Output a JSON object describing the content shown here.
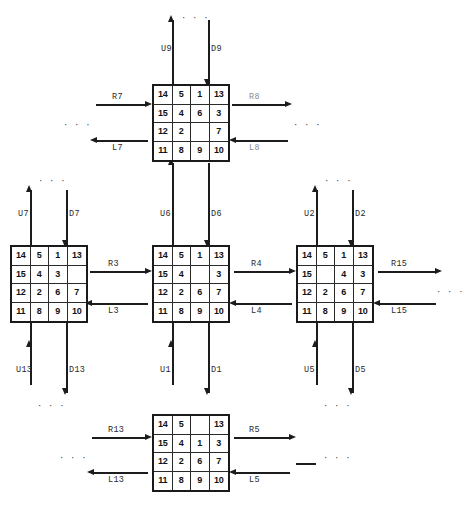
{
  "diagram": {
    "blank_symbol": "",
    "continuation": "· · ·"
  },
  "states": {
    "top": {
      "name": "top-state",
      "rows": [
        [
          "14",
          "5",
          "1",
          "13"
        ],
        [
          "15",
          "4",
          "6",
          "3"
        ],
        [
          "12",
          "2",
          "",
          "7"
        ],
        [
          "11",
          "8",
          "9",
          "10"
        ]
      ]
    },
    "left": {
      "name": "left-state",
      "rows": [
        [
          "14",
          "5",
          "1",
          "13"
        ],
        [
          "15",
          "4",
          "3",
          ""
        ],
        [
          "12",
          "2",
          "6",
          "7"
        ],
        [
          "11",
          "8",
          "9",
          "10"
        ]
      ]
    },
    "center": {
      "name": "center-state",
      "rows": [
        [
          "14",
          "5",
          "1",
          "13"
        ],
        [
          "15",
          "4",
          "",
          "3"
        ],
        [
          "12",
          "2",
          "6",
          "7"
        ],
        [
          "11",
          "8",
          "9",
          "10"
        ]
      ]
    },
    "right": {
      "name": "right-state",
      "rows": [
        [
          "14",
          "5",
          "1",
          "13"
        ],
        [
          "15",
          "",
          "4",
          "3"
        ],
        [
          "12",
          "2",
          "6",
          "7"
        ],
        [
          "11",
          "8",
          "9",
          "10"
        ]
      ]
    },
    "bottom": {
      "name": "bottom-state",
      "rows": [
        [
          "14",
          "5",
          "",
          "13"
        ],
        [
          "15",
          "4",
          "1",
          "3"
        ],
        [
          "12",
          "2",
          "6",
          "7"
        ],
        [
          "11",
          "8",
          "9",
          "10"
        ]
      ]
    }
  },
  "edges": {
    "top_up": "U9",
    "top_down": "D9",
    "top_left_in": "R7",
    "top_left_out": "L7",
    "top_right_in": "R8",
    "top_right_out": "L8",
    "left_up": "U7",
    "left_down": "D7",
    "left_below_up": "U13",
    "left_below_down": "D13",
    "center_up": "U6",
    "center_down": "D6",
    "left_to_center_in": "R3",
    "left_to_center_out": "L3",
    "center_to_right_in": "R4",
    "center_to_right_out": "L4",
    "right_up": "U2",
    "right_down": "D2",
    "right_far_in": "R15",
    "right_far_out": "L15",
    "center_below_up": "U1",
    "center_below_down": "D1",
    "right_below_up": "U5",
    "right_below_down": "D5",
    "bottom_left_in": "R13",
    "bottom_left_out": "L13",
    "bottom_right_in": "R5",
    "bottom_right_out": "L5"
  }
}
